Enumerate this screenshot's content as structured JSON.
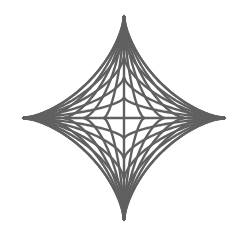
{
  "figure": {
    "shape": "astroid-string-art",
    "center": [
      124,
      118
    ],
    "radius_x": 101,
    "radius_y": 102,
    "line_color": "#606060",
    "line_width": 2.4,
    "background": "#ffffff",
    "fractions": [
      -1,
      -0.8,
      -0.6,
      -0.4,
      -0.2,
      0,
      0.2,
      0.4,
      0.6,
      0.8,
      1
    ]
  }
}
